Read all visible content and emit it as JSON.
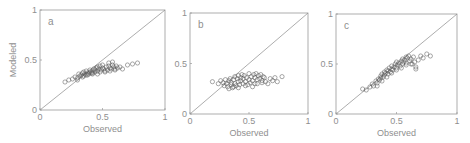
{
  "figure": {
    "ylabel": "Modeled",
    "xlabel": "Observed",
    "tick_labels": [
      "0",
      "0.5",
      "1"
    ]
  },
  "colors": {
    "axis": "#9a9a9a",
    "marker": "#555555",
    "diagonal": "#8a8a8a",
    "text": "#8f8f8f"
  },
  "chart_data": [
    {
      "type": "scatter",
      "panel_label": "a",
      "title": "",
      "xlabel": "Observed",
      "ylabel": "Modeled",
      "xlim": [
        0,
        1
      ],
      "ylim": [
        0,
        1
      ],
      "xticks": [
        0,
        0.5,
        1
      ],
      "yticks": [
        0,
        0.5,
        1
      ],
      "reference_line": "y = x",
      "grid": false,
      "marker": "open-circle",
      "x": [
        0.2,
        0.23,
        0.26,
        0.28,
        0.3,
        0.31,
        0.32,
        0.33,
        0.34,
        0.35,
        0.35,
        0.36,
        0.37,
        0.37,
        0.38,
        0.39,
        0.4,
        0.4,
        0.41,
        0.42,
        0.42,
        0.43,
        0.44,
        0.44,
        0.45,
        0.46,
        0.46,
        0.47,
        0.48,
        0.48,
        0.49,
        0.5,
        0.5,
        0.51,
        0.52,
        0.53,
        0.54,
        0.55,
        0.55,
        0.56,
        0.57,
        0.58,
        0.58,
        0.59,
        0.6,
        0.61,
        0.62,
        0.64,
        0.66,
        0.7,
        0.74,
        0.78,
        0.3,
        0.34,
        0.38,
        0.42,
        0.46,
        0.52,
        0.56,
        0.6
      ],
      "y": [
        0.28,
        0.3,
        0.31,
        0.33,
        0.32,
        0.36,
        0.34,
        0.35,
        0.37,
        0.34,
        0.38,
        0.36,
        0.35,
        0.39,
        0.37,
        0.36,
        0.38,
        0.4,
        0.37,
        0.39,
        0.36,
        0.41,
        0.38,
        0.4,
        0.42,
        0.39,
        0.43,
        0.41,
        0.38,
        0.44,
        0.4,
        0.42,
        0.45,
        0.41,
        0.39,
        0.43,
        0.4,
        0.44,
        0.47,
        0.42,
        0.41,
        0.45,
        0.48,
        0.43,
        0.4,
        0.44,
        0.42,
        0.43,
        0.41,
        0.45,
        0.46,
        0.47,
        0.3,
        0.33,
        0.35,
        0.37,
        0.36,
        0.38,
        0.39,
        0.41
      ]
    },
    {
      "type": "scatter",
      "panel_label": "b",
      "title": "",
      "xlabel": "Observed",
      "ylabel": "",
      "xlim": [
        0,
        1
      ],
      "ylim": [
        0,
        1
      ],
      "xticks": [
        0,
        0.5,
        1
      ],
      "yticks": [
        0,
        0.5,
        1
      ],
      "reference_line": "y = x",
      "grid": false,
      "marker": "open-circle",
      "x": [
        0.19,
        0.24,
        0.26,
        0.28,
        0.29,
        0.3,
        0.31,
        0.32,
        0.33,
        0.34,
        0.35,
        0.35,
        0.36,
        0.37,
        0.38,
        0.38,
        0.39,
        0.4,
        0.41,
        0.41,
        0.42,
        0.43,
        0.43,
        0.44,
        0.45,
        0.45,
        0.46,
        0.47,
        0.48,
        0.49,
        0.5,
        0.5,
        0.51,
        0.52,
        0.53,
        0.54,
        0.55,
        0.55,
        0.56,
        0.57,
        0.58,
        0.59,
        0.6,
        0.61,
        0.62,
        0.63,
        0.64,
        0.66,
        0.68,
        0.7,
        0.72,
        0.74,
        0.78,
        0.33,
        0.37,
        0.41,
        0.47,
        0.53,
        0.57,
        0.61
      ],
      "y": [
        0.32,
        0.3,
        0.33,
        0.31,
        0.28,
        0.34,
        0.3,
        0.27,
        0.33,
        0.35,
        0.29,
        0.31,
        0.26,
        0.34,
        0.3,
        0.37,
        0.28,
        0.35,
        0.32,
        0.38,
        0.29,
        0.36,
        0.33,
        0.39,
        0.3,
        0.35,
        0.38,
        0.32,
        0.36,
        0.29,
        0.34,
        0.4,
        0.31,
        0.37,
        0.33,
        0.39,
        0.3,
        0.36,
        0.4,
        0.34,
        0.38,
        0.35,
        0.39,
        0.33,
        0.37,
        0.36,
        0.32,
        0.3,
        0.35,
        0.33,
        0.36,
        0.32,
        0.37,
        0.25,
        0.27,
        0.26,
        0.28,
        0.27,
        0.3,
        0.31
      ]
    },
    {
      "type": "scatter",
      "panel_label": "c",
      "title": "",
      "xlabel": "Observed",
      "ylabel": "",
      "xlim": [
        0,
        1
      ],
      "ylim": [
        0,
        1
      ],
      "xticks": [
        0,
        0.5,
        1
      ],
      "yticks": [
        0,
        0.5,
        1
      ],
      "reference_line": "y = x",
      "grid": false,
      "marker": "open-circle",
      "x": [
        0.22,
        0.25,
        0.28,
        0.3,
        0.31,
        0.33,
        0.34,
        0.35,
        0.36,
        0.37,
        0.37,
        0.38,
        0.39,
        0.4,
        0.4,
        0.41,
        0.42,
        0.43,
        0.43,
        0.44,
        0.45,
        0.46,
        0.46,
        0.47,
        0.48,
        0.49,
        0.5,
        0.5,
        0.51,
        0.52,
        0.53,
        0.54,
        0.55,
        0.55,
        0.56,
        0.57,
        0.58,
        0.58,
        0.59,
        0.6,
        0.61,
        0.62,
        0.63,
        0.64,
        0.65,
        0.66,
        0.68,
        0.7,
        0.72,
        0.75,
        0.78,
        0.34,
        0.38,
        0.42,
        0.46,
        0.5,
        0.54,
        0.58,
        0.62,
        0.66
      ],
      "y": [
        0.25,
        0.24,
        0.27,
        0.3,
        0.28,
        0.33,
        0.31,
        0.35,
        0.34,
        0.38,
        0.36,
        0.4,
        0.37,
        0.42,
        0.39,
        0.41,
        0.44,
        0.4,
        0.43,
        0.46,
        0.42,
        0.45,
        0.48,
        0.44,
        0.47,
        0.5,
        0.46,
        0.52,
        0.49,
        0.51,
        0.48,
        0.53,
        0.5,
        0.55,
        0.52,
        0.54,
        0.57,
        0.51,
        0.56,
        0.58,
        0.53,
        0.55,
        0.5,
        0.57,
        0.52,
        0.47,
        0.54,
        0.58,
        0.56,
        0.6,
        0.58,
        0.28,
        0.33,
        0.37,
        0.41,
        0.44,
        0.46,
        0.49,
        0.5,
        0.45
      ]
    }
  ]
}
